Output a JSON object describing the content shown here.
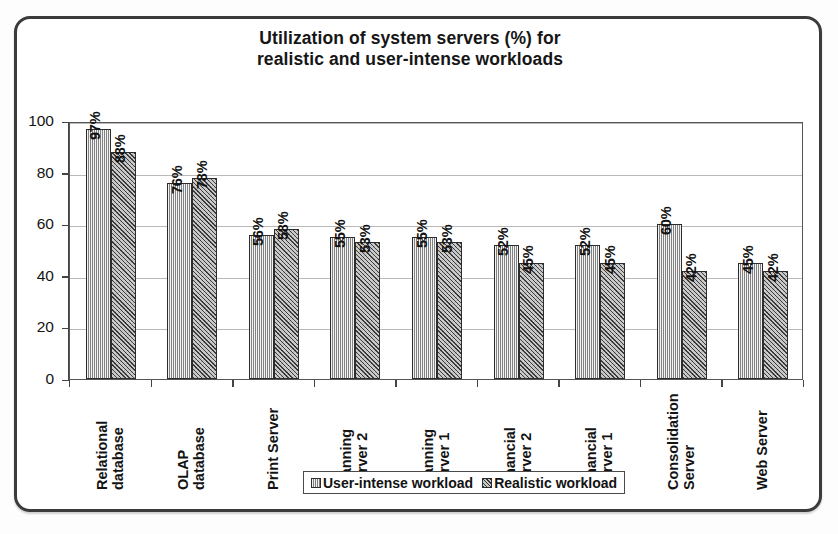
{
  "chart_data": {
    "type": "bar",
    "title": "Utilization of system servers (%) for realistic and user-intense workloads",
    "title_line1": "Utilization of system servers (%) for",
    "title_line2": "realistic and user-intense workloads",
    "xlabel": "",
    "ylabel": "",
    "ylim": [
      0,
      100
    ],
    "yticks": [
      0,
      20,
      40,
      60,
      80,
      100
    ],
    "ytick_labels": [
      "0",
      "20",
      "40",
      "60",
      "80",
      "100"
    ],
    "grid": true,
    "legend_position": "bottom-center",
    "categories": [
      "Relational database",
      "OLAP database",
      "Print Server",
      "Planning Server 2",
      "Planning Server 1",
      "Financial Server 2",
      "Financial Server 1",
      "Consolidation Server",
      "Web Server"
    ],
    "category_lines": [
      [
        "Relational",
        "database"
      ],
      [
        "OLAP",
        "database"
      ],
      [
        "Print Server"
      ],
      [
        "Planning",
        "Server 2"
      ],
      [
        "Planning",
        "Server 1"
      ],
      [
        "Financial",
        "Server 2"
      ],
      [
        "Financial",
        "Server 1"
      ],
      [
        "Consolidation",
        "Server"
      ],
      [
        "Web Server"
      ]
    ],
    "series": [
      {
        "name": "User-intense workload",
        "values": [
          97,
          76,
          56,
          55,
          55,
          52,
          52,
          60,
          45
        ],
        "labels": [
          "97%",
          "76%",
          "56%",
          "55%",
          "55%",
          "52%",
          "52%",
          "60%",
          "45%"
        ],
        "fill": "light-vertical-hatch",
        "color": "#b2b2b2"
      },
      {
        "name": "Realistic workload",
        "values": [
          88,
          78,
          58,
          53,
          53,
          45,
          45,
          42,
          42
        ],
        "labels": [
          "88%",
          "78%",
          "58%",
          "53%",
          "53%",
          "45%",
          "45%",
          "42%",
          "42%"
        ],
        "fill": "dark-cross-hatch",
        "color": "#8d8d8d"
      }
    ]
  },
  "legend": {
    "items": [
      {
        "label": "User-intense workload"
      },
      {
        "label": "Realistic workload"
      }
    ]
  },
  "colors": {
    "frame": "#3b3b3b",
    "axis": "#444444",
    "grid": "#b9b9b9",
    "text": "#131313",
    "series_light": "#b2b2b2",
    "series_dark": "#8d8d8d"
  }
}
